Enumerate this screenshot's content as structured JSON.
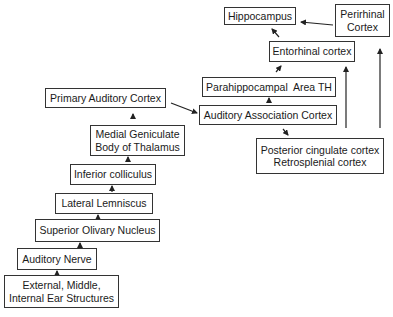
{
  "diagram": {
    "nodes": [
      {
        "id": "ear",
        "label": "External, Middle,\nInternal Ear Structures"
      },
      {
        "id": "nerve",
        "label": "Auditory Nerve"
      },
      {
        "id": "olivary",
        "label": "Superior Olivary Nucleus"
      },
      {
        "id": "lemniscus",
        "label": "Lateral Lemniscus"
      },
      {
        "id": "colliculus",
        "label": "Inferior colliculus"
      },
      {
        "id": "geniculate",
        "label": "Medial Geniculate\nBody of Thalamus"
      },
      {
        "id": "primary",
        "label": "Primary Auditory Cortex"
      },
      {
        "id": "association",
        "label": "Auditory Association Cortex"
      },
      {
        "id": "posterior",
        "label": "Posterior cingulate cortex\nRetrosplenial cortex"
      },
      {
        "id": "parahippocampal",
        "label": "Parahippocampal  Area TH"
      },
      {
        "id": "entorhinal",
        "label": "Entorhinal cortex"
      },
      {
        "id": "hippocampus",
        "label": "Hippocampus"
      },
      {
        "id": "perirhinal",
        "label": "Perirhinal\nCortex"
      }
    ],
    "edges": [
      [
        "ear",
        "nerve"
      ],
      [
        "nerve",
        "olivary"
      ],
      [
        "olivary",
        "lemniscus"
      ],
      [
        "lemniscus",
        "colliculus"
      ],
      [
        "colliculus",
        "geniculate"
      ],
      [
        "geniculate",
        "primary"
      ],
      [
        "primary",
        "association"
      ],
      [
        "association",
        "parahippocampal"
      ],
      [
        "association",
        "posterior"
      ],
      [
        "parahippocampal",
        "entorhinal"
      ],
      [
        "posterior",
        "entorhinal"
      ],
      [
        "posterior",
        "perirhinal"
      ],
      [
        "entorhinal",
        "hippocampus"
      ],
      [
        "perirhinal",
        "hippocampus"
      ]
    ]
  },
  "labels": {
    "ear_1": "External, Middle,",
    "ear_2": "Internal Ear Structures",
    "nerve": "Auditory Nerve",
    "olivary": "Superior Olivary Nucleus",
    "lemniscus": "Lateral Lemniscus",
    "colliculus": "Inferior colliculus",
    "geniculate_1": "Medial Geniculate",
    "geniculate_2": "Body of Thalamus",
    "primary": "Primary Auditory Cortex",
    "association": "Auditory Association Cortex",
    "posterior_1": "Posterior cingulate cortex",
    "posterior_2": "Retrosplenial cortex",
    "parahippocampal": "Parahippocampal  Area TH",
    "entorhinal": "Entorhinal cortex",
    "hippocampus": "Hippocampus",
    "perirhinal_1": "Perirhinal",
    "perirhinal_2": "Cortex"
  }
}
